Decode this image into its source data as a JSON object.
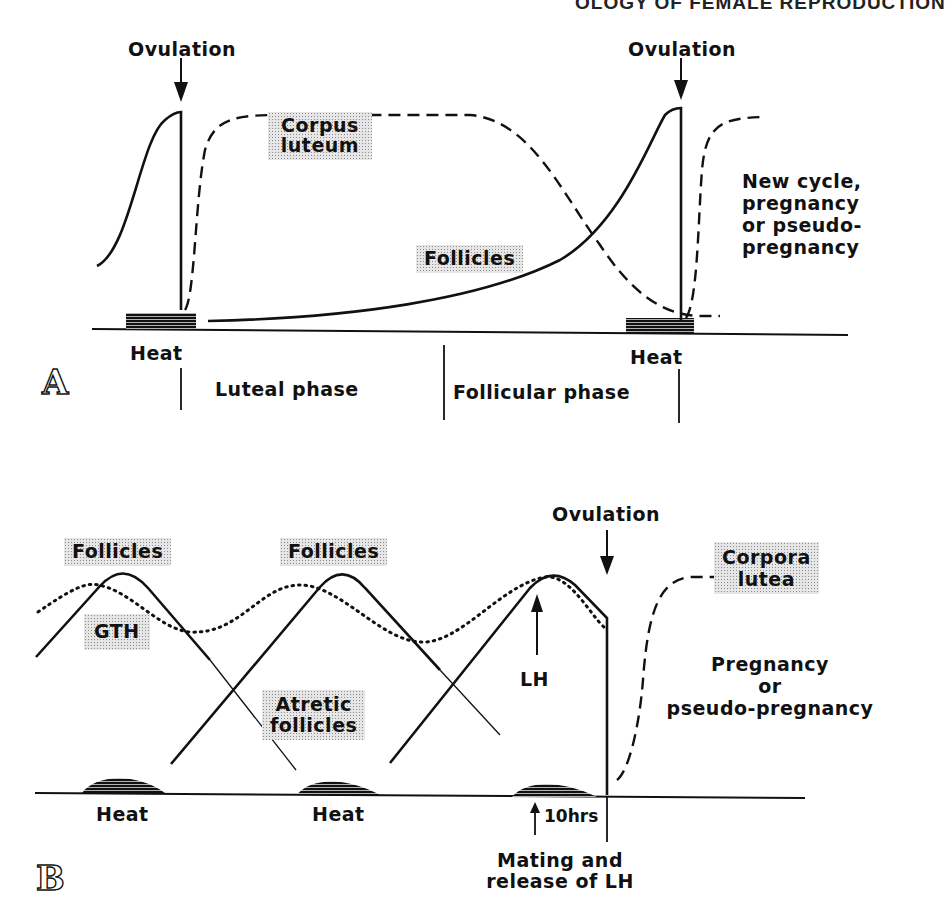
{
  "running_head": "OLOGY OF FEMALE REPRODUCTION",
  "panel_a": {
    "letter": "A",
    "ovulation_left": "Ovulation",
    "ovulation_right": "Ovulation",
    "corpus_luteum": "Corpus luteum",
    "follicles": "Follicles",
    "heat_left": "Heat",
    "heat_right": "Heat",
    "luteal_phase": "Luteal phase",
    "follicular_phase": "Follicular phase",
    "outcome": [
      "New cycle,",
      "pregnancy",
      "or pseudo-",
      "pregnancy"
    ]
  },
  "panel_b": {
    "letter": "B",
    "ovulation": "Ovulation",
    "follicles_1": "Follicles",
    "follicles_2": "Follicles",
    "gth": "GTH",
    "atretic_follicles": [
      "Atretic",
      "follicles"
    ],
    "lh": "LH",
    "corpora_lutea": [
      "Corpora",
      "lutea"
    ],
    "outcome": [
      "Pregnancy",
      "or",
      "pseudo-pregnancy"
    ],
    "heat_1": "Heat",
    "heat_2": "Heat",
    "interval": "10hrs",
    "mating_note": [
      "Mating and",
      "release of LH"
    ]
  },
  "colors": {
    "ink": "#111111",
    "stipple_bg": "#e6e6e6",
    "stipple_dot": "#8c8c8c",
    "paper": "#ffffff"
  }
}
